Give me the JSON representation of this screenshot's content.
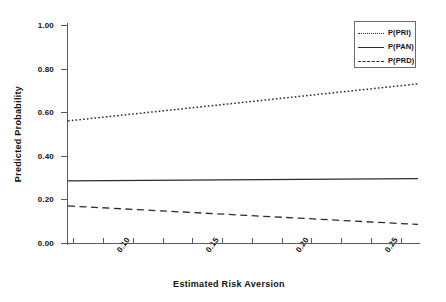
{
  "chart_data": {
    "type": "line",
    "title": "",
    "xlabel": "Estimated Risk Aversion",
    "ylabel": "Predicted Probability",
    "xlim": [
      0.072,
      0.268
    ],
    "ylim": [
      0.0,
      1.0
    ],
    "grid": false,
    "legend_position": "top-right",
    "yticks": [
      "1.00",
      "0.80",
      "0.60",
      "0.40",
      "0.20",
      "0.00"
    ],
    "ytick_values": [
      1.0,
      0.8,
      0.6,
      0.4,
      0.2,
      0.0
    ],
    "xticks": [
      "0.10",
      "0.15",
      "0.20",
      "0.25"
    ],
    "xtick_values": [
      0.1,
      0.15,
      0.2,
      0.25
    ],
    "x": [
      0.072,
      0.268
    ],
    "series": [
      {
        "name": "P(PRI)",
        "style": "dotted",
        "color": "#2b2b2b",
        "values": [
          0.56,
          0.73
        ]
      },
      {
        "name": "P(PAN)",
        "style": "solid",
        "color": "#2b2b2b",
        "values": [
          0.285,
          0.295
        ]
      },
      {
        "name": "P(PRD)",
        "style": "dashed",
        "color": "#2b2b2b",
        "values": [
          0.17,
          0.085
        ]
      }
    ]
  },
  "legend": {
    "items": [
      {
        "label": "P(PRI)",
        "style": "dotted"
      },
      {
        "label": "P(PAN)",
        "style": "solid"
      },
      {
        "label": "P(PRD)",
        "style": "dashed"
      }
    ]
  }
}
